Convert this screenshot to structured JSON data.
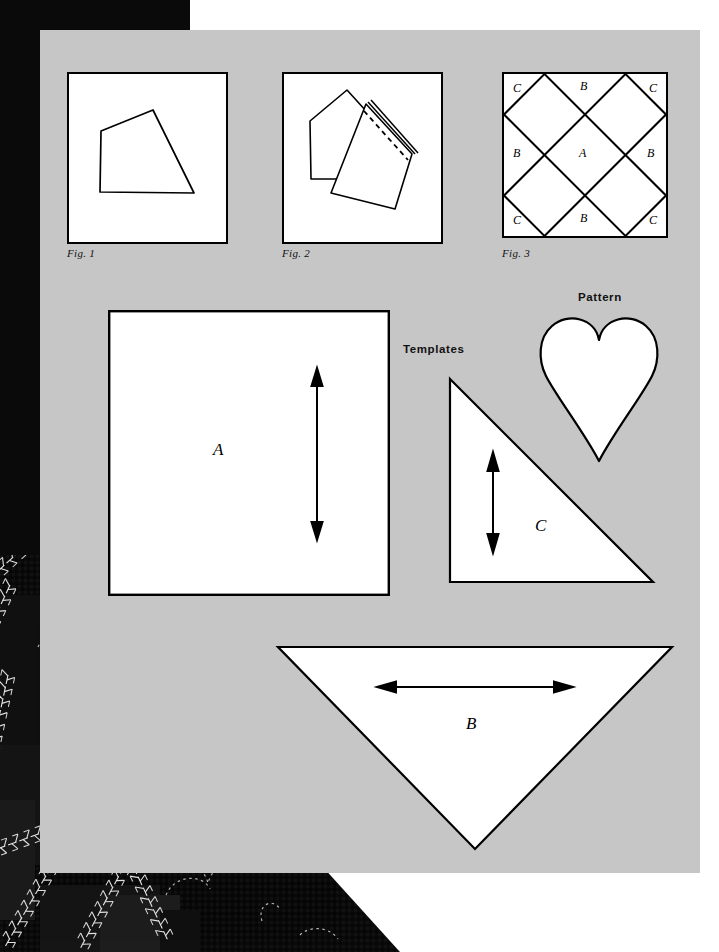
{
  "page": {
    "background_color": "#ffffff",
    "panel_color": "#c6c6c6",
    "ink_color": "#000000",
    "photo_color": "#0a0a0a"
  },
  "figures": [
    {
      "id": "fig1",
      "caption": "Fig. 1",
      "content": "folded-fabric-quadrilateral"
    },
    {
      "id": "fig2",
      "caption": "Fig. 2",
      "content": "folded-fabric-with-dashed-stitch-line"
    },
    {
      "id": "fig3",
      "caption": "Fig. 3",
      "content": "diamond-lattice-block-layout"
    }
  ],
  "fig3_grid": {
    "cells": [
      {
        "label": "C",
        "position": "top-left"
      },
      {
        "label": "B",
        "position": "top-center"
      },
      {
        "label": "C",
        "position": "top-right"
      },
      {
        "label": "B",
        "position": "middle-left"
      },
      {
        "label": "A",
        "position": "center"
      },
      {
        "label": "B",
        "position": "middle-right"
      },
      {
        "label": "C",
        "position": "bottom-left"
      },
      {
        "label": "B",
        "position": "bottom-center"
      },
      {
        "label": "C",
        "position": "bottom-right"
      }
    ]
  },
  "labels": {
    "templates": "Templates",
    "pattern": "Pattern"
  },
  "templates": [
    {
      "id": "template-a",
      "letter": "A",
      "shape": "square",
      "grainline": "vertical-double-arrow"
    },
    {
      "id": "template-c",
      "letter": "C",
      "shape": "right-triangle",
      "grainline": "vertical-double-arrow"
    },
    {
      "id": "template-b",
      "letter": "B",
      "shape": "inverted-triangle",
      "grainline": "horizontal-double-arrow"
    }
  ],
  "pattern": {
    "id": "pattern-heart",
    "shape": "heart",
    "label": "Pattern"
  },
  "photo": {
    "id": "quilted-fabric-photo",
    "description": "dark quilted fabric with feather stitch embroidery and dashed heart quilting outlines"
  }
}
